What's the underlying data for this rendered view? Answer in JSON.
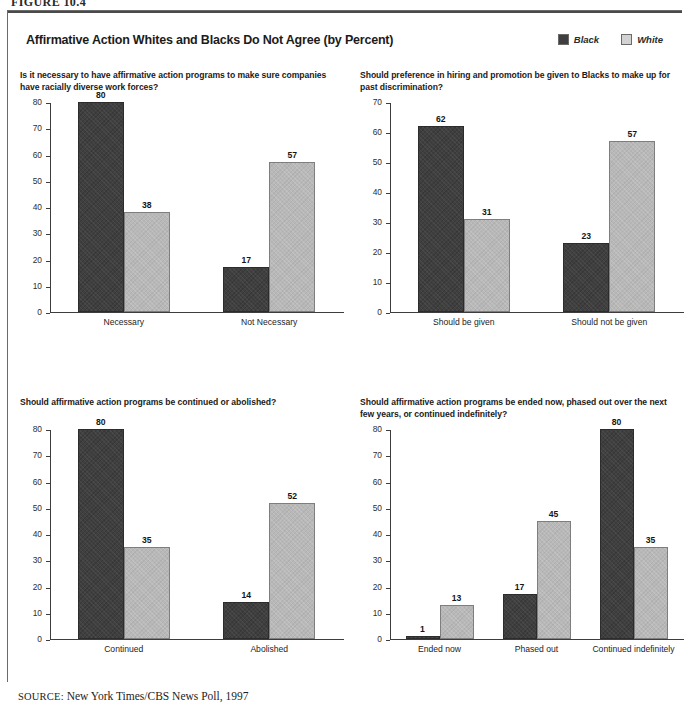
{
  "figure_number": "FIGURE 10.4",
  "title": "Affirmative Action Whites and Blacks Do Not Agree (by Percent)",
  "legend": {
    "position": "top-right",
    "items": [
      {
        "label": "Black",
        "color": "#3f3f3f"
      },
      {
        "label": "White",
        "color": "#b8b8b8"
      }
    ]
  },
  "source": {
    "keyword": "SOURCE:",
    "text": "New York Times/CBS News Poll, 1997"
  },
  "chart_data": [
    {
      "type": "bar",
      "panel": 1,
      "title": "Is it necessary to have affirmative action programs to make sure companies have racially diverse work forces?",
      "categories": [
        "Necessary",
        "Not Necessary"
      ],
      "series": [
        {
          "name": "Black",
          "values": [
            80,
            17
          ],
          "color": "#3f3f3f"
        },
        {
          "name": "White",
          "values": [
            38,
            57
          ],
          "color": "#b8b8b8"
        }
      ],
      "yticks": [
        0,
        10,
        20,
        30,
        40,
        50,
        60,
        70,
        80
      ],
      "ylim": [
        0,
        80
      ],
      "xlabel": "",
      "ylabel": "",
      "grid": false,
      "data_labels": true
    },
    {
      "type": "bar",
      "panel": 2,
      "title": "Should preference in hiring and promotion be given to Blacks to make up for past discrimination?",
      "categories": [
        "Should be given",
        "Should not be given"
      ],
      "series": [
        {
          "name": "Black",
          "values": [
            62,
            23
          ],
          "color": "#3f3f3f"
        },
        {
          "name": "White",
          "values": [
            31,
            57
          ],
          "color": "#b8b8b8"
        }
      ],
      "yticks": [
        0,
        10,
        20,
        30,
        40,
        50,
        60,
        70
      ],
      "ylim": [
        0,
        70
      ],
      "xlabel": "",
      "ylabel": "",
      "grid": false,
      "data_labels": true
    },
    {
      "type": "bar",
      "panel": 3,
      "title": "Should affirmative action programs be continued or abolished?",
      "categories": [
        "Continued",
        "Abolished"
      ],
      "series": [
        {
          "name": "Black",
          "values": [
            80,
            14
          ],
          "color": "#3f3f3f"
        },
        {
          "name": "White",
          "values": [
            35,
            52
          ],
          "color": "#b8b8b8"
        }
      ],
      "yticks": [
        0,
        10,
        20,
        30,
        40,
        50,
        60,
        70,
        80
      ],
      "ylim": [
        0,
        80
      ],
      "xlabel": "",
      "ylabel": "",
      "grid": false,
      "data_labels": true
    },
    {
      "type": "bar",
      "panel": 4,
      "title": "Should affirmative action programs be ended now, phased out over the next few years, or continued indefinitely?",
      "categories": [
        "Ended now",
        "Phased out",
        "Continued indefinitely"
      ],
      "series": [
        {
          "name": "Black",
          "values": [
            1,
            17,
            80
          ],
          "color": "#3f3f3f"
        },
        {
          "name": "White",
          "values": [
            13,
            45,
            35
          ],
          "color": "#b8b8b8"
        }
      ],
      "yticks": [
        0,
        10,
        20,
        30,
        40,
        50,
        60,
        70,
        80
      ],
      "ylim": [
        0,
        80
      ],
      "xlabel": "",
      "ylabel": "",
      "grid": false,
      "data_labels": true
    }
  ]
}
